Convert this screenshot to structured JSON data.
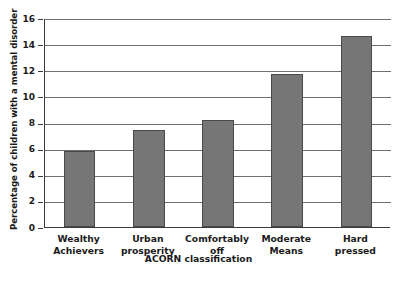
{
  "chart_data": {
    "type": "bar",
    "title": "",
    "xlabel": "ACORN classification",
    "ylabel": "Percentage of children with a mental disorder",
    "categories": [
      "Wealthy Achievers",
      "Urban prosperity",
      "Comfortably off",
      "Moderate Means",
      "Hard pressed"
    ],
    "category_lines": [
      [
        "Wealthy",
        "Achievers"
      ],
      [
        "Urban",
        "prosperity"
      ],
      [
        "Comfortably",
        "off"
      ],
      [
        "Moderate",
        "Means"
      ],
      [
        "Hard",
        "pressed"
      ]
    ],
    "values": [
      5.8,
      7.4,
      8.2,
      11.7,
      14.6
    ],
    "ylim": [
      0,
      16
    ],
    "ytick_values": [
      0,
      2,
      4,
      6,
      8,
      10,
      12,
      14,
      16
    ],
    "ytick_labels": [
      "0",
      "2",
      "4",
      "6",
      "8",
      "10",
      "12",
      "14",
      "16"
    ],
    "grid": true,
    "legend": false,
    "bar_color": "#767676",
    "bar_edge_color": "#4a4a4a",
    "gridline_color": "#6e6e6e",
    "axis_color": "#3b3b3b"
  },
  "caption": {
    "text": ""
  }
}
